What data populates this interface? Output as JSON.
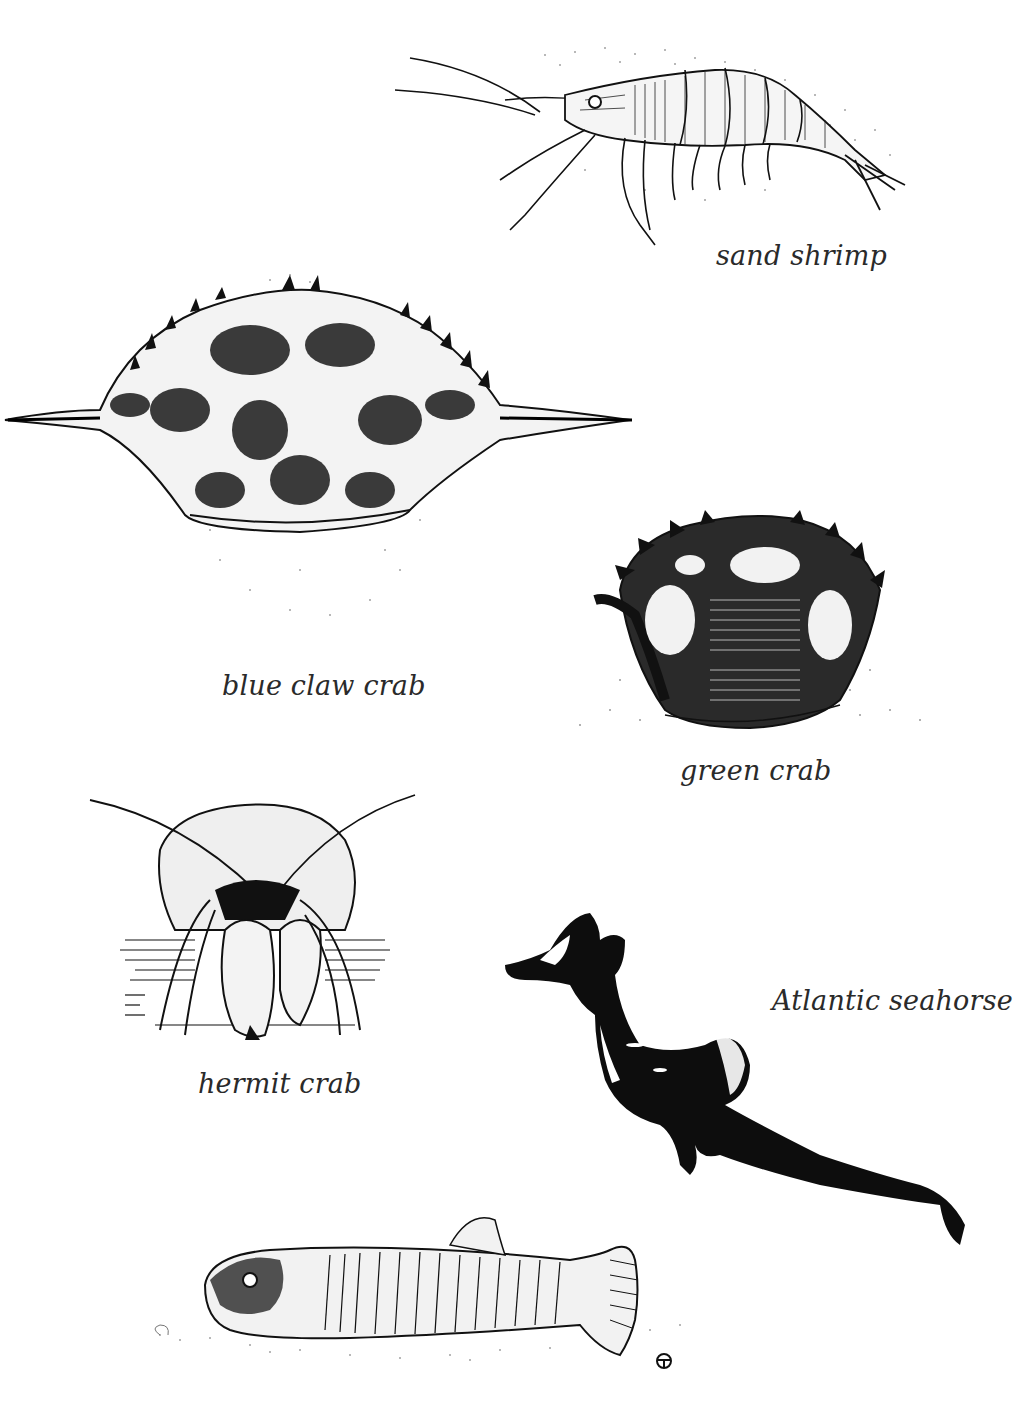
{
  "plate": {
    "background": "#ffffff",
    "ink_color": "#111111",
    "caption_color": "#2a2a2a"
  },
  "figures": [
    {
      "id": "sand-shrimp",
      "caption": "sand shrimp",
      "style": "pen-and-ink line drawing with stipple shading"
    },
    {
      "id": "blue-claw-crab",
      "caption": "blue claw crab",
      "style": "pen-and-ink hatched drawing with stipple shadow"
    },
    {
      "id": "green-crab",
      "caption": "green crab",
      "style": "pen-and-ink hatched drawing with stipple shadow"
    },
    {
      "id": "hermit-crab",
      "caption": "hermit crab",
      "style": "pen-and-ink line drawing with horizontal hatching"
    },
    {
      "id": "atlantic-seahorse",
      "caption": "Atlantic seahorse",
      "style": "solid black silhouette with white highlights"
    },
    {
      "id": "killifish",
      "caption": "",
      "style": "pen-and-ink hatched drawing with stippled ground"
    }
  ],
  "artist_mark": {
    "icon": "circled-t-monogram-icon"
  }
}
